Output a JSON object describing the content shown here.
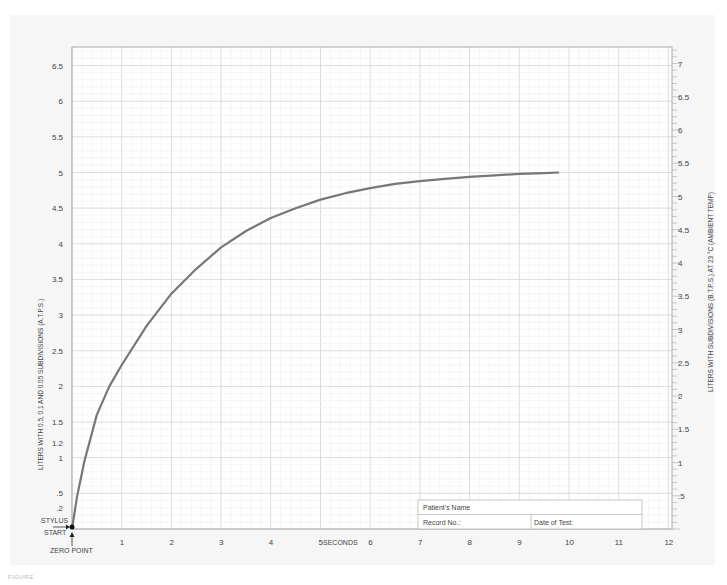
{
  "chart_data": {
    "type": "line",
    "title": "",
    "xlabel": "SECONDS",
    "ylabel_left": "LITERS WITH 0.5, 0.1 AND 0.05 SUBDIVISIONS (A.T.P.S.)",
    "ylabel_right": "LITERS WITH SUBDIVISIONS (B.T.P.S.) AT 23 °C (AMBIENT TEMP)",
    "xlim": [
      0,
      12
    ],
    "ylim_left": [
      0,
      6.9
    ],
    "ylim_right": [
      0,
      7.4
    ],
    "grid": true,
    "x_ticks": [
      "1",
      "2",
      "3",
      "4",
      "5",
      "6",
      "7",
      "8",
      "9",
      "10",
      "11",
      "12"
    ],
    "y_left_ticks": [
      ".2",
      ".5",
      "1",
      "1.2",
      "1.5",
      "2",
      "2.5",
      "3",
      "3.5",
      "4",
      "4.5",
      "5",
      "5.5",
      "6",
      "6.5"
    ],
    "y_left_tick_values": [
      0.2,
      0.5,
      1,
      1.2,
      1.5,
      2,
      2.5,
      3,
      3.5,
      4,
      4.5,
      5,
      5.5,
      6,
      6.5
    ],
    "y_right_ticks": [
      ".5",
      "1",
      "1.5",
      "2",
      "2.5",
      "3",
      "3.5",
      "4",
      "4.5",
      "5",
      "5.5",
      "6",
      "6.5",
      "7"
    ],
    "y_right_tick_values": [
      0.5,
      1,
      1.5,
      2,
      2.5,
      3,
      3.5,
      4,
      4.5,
      5,
      5.5,
      6,
      6.5,
      7
    ],
    "series": [
      {
        "name": "Volume-time curve",
        "color": "#777777",
        "x": [
          0,
          0.1,
          0.25,
          0.5,
          0.75,
          1,
          1.5,
          2,
          2.5,
          3,
          3.5,
          4,
          4.5,
          5,
          5.5,
          6,
          6.5,
          7,
          7.5,
          8,
          8.5,
          9,
          9.5,
          9.8
        ],
        "y": [
          0,
          0.45,
          0.95,
          1.6,
          2.0,
          2.3,
          2.85,
          3.3,
          3.65,
          3.95,
          4.18,
          4.36,
          4.5,
          4.62,
          4.71,
          4.78,
          4.84,
          4.88,
          4.91,
          4.94,
          4.96,
          4.98,
          4.99,
          5.0
        ]
      }
    ],
    "annotations": [
      "STYLUS",
      "START",
      "ZERO POINT"
    ]
  },
  "info_box": {
    "patient_name_label": "Patient's Name",
    "record_no_label": "Record No.:",
    "date_label": "Date of Test:"
  },
  "caption": "FIGURE"
}
